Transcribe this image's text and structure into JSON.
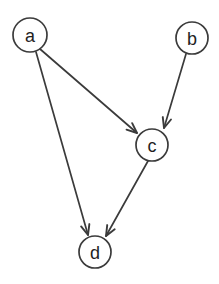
{
  "diagram": {
    "type": "directed-graph",
    "background_color": "#ffffff",
    "stroke_color": "#3b3b3b",
    "label_color": "#1f1f1f",
    "node_radius": 16,
    "nodes": [
      {
        "id": "a",
        "label": "a",
        "cx": 30,
        "cy": 35,
        "r": 17
      },
      {
        "id": "b",
        "label": "b",
        "cx": 192,
        "cy": 38,
        "r": 16
      },
      {
        "id": "c",
        "label": "c",
        "cx": 152,
        "cy": 145,
        "r": 16
      },
      {
        "id": "d",
        "label": "d",
        "cx": 95,
        "cy": 252,
        "r": 16
      }
    ],
    "edges": [
      {
        "id": "a-c",
        "from": "a",
        "to": "c",
        "directed": true,
        "x1": 40,
        "y1": 49,
        "x2": 137,
        "y2": 133
      },
      {
        "id": "a-d",
        "from": "a",
        "to": "d",
        "directed": true,
        "x1": 36,
        "y1": 52,
        "x2": 88,
        "y2": 235
      },
      {
        "id": "b-c",
        "from": "b",
        "to": "c",
        "directed": true,
        "x1": 186,
        "y1": 54,
        "x2": 164,
        "y2": 128
      },
      {
        "id": "c-d",
        "from": "c",
        "to": "d",
        "directed": true,
        "x1": 148,
        "y1": 161,
        "x2": 106,
        "y2": 236
      }
    ]
  }
}
